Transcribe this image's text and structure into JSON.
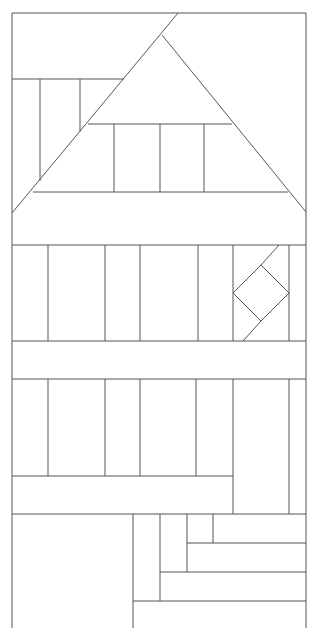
{
  "diagram": {
    "type": "quilt-block-house",
    "width": 309,
    "height": 628,
    "stroke_color": "#555555",
    "background": "#ffffff",
    "frame": {
      "points": [
        [
          12,
          628
        ],
        [
          12,
          13
        ],
        [
          306,
          13
        ],
        [
          306,
          628
        ]
      ]
    },
    "segments": [
      {
        "name": "roof-left-diagonal",
        "x1": 178,
        "y1": 13,
        "x2": 12,
        "y2": 213
      },
      {
        "name": "roof-right-diagonal",
        "x1": 162,
        "y1": 35,
        "x2": 306,
        "y2": 212
      },
      {
        "name": "chimney-top-line",
        "x1": 12,
        "y1": 79,
        "x2": 124,
        "y2": 79
      },
      {
        "name": "chimney-vertical-1",
        "x1": 40,
        "y1": 79,
        "x2": 40,
        "y2": 181
      },
      {
        "name": "chimney-vertical-2",
        "x1": 80,
        "y1": 79,
        "x2": 80,
        "y2": 132
      },
      {
        "name": "roof-inner-line",
        "x1": 88,
        "y1": 124,
        "x2": 232,
        "y2": 124
      },
      {
        "name": "roof-base-line",
        "x1": 33,
        "y1": 192,
        "x2": 288,
        "y2": 192
      },
      {
        "name": "roof-strip-vertical-1",
        "x1": 114,
        "y1": 124,
        "x2": 114,
        "y2": 192
      },
      {
        "name": "roof-strip-vertical-2",
        "x1": 160,
        "y1": 124,
        "x2": 160,
        "y2": 192
      },
      {
        "name": "roof-strip-vertical-3",
        "x1": 204,
        "y1": 124,
        "x2": 204,
        "y2": 192
      },
      {
        "name": "upper-row-top",
        "x1": 12,
        "y1": 245,
        "x2": 306,
        "y2": 245
      },
      {
        "name": "upper-row-bottom",
        "x1": 12,
        "y1": 341,
        "x2": 306,
        "y2": 341
      },
      {
        "name": "upper-vertical-1",
        "x1": 48,
        "y1": 245,
        "x2": 48,
        "y2": 341
      },
      {
        "name": "upper-vertical-2",
        "x1": 105,
        "y1": 245,
        "x2": 105,
        "y2": 341
      },
      {
        "name": "upper-vertical-3",
        "x1": 140,
        "y1": 245,
        "x2": 140,
        "y2": 341
      },
      {
        "name": "upper-vertical-4",
        "x1": 198,
        "y1": 245,
        "x2": 198,
        "y2": 341
      },
      {
        "name": "upper-vertical-5",
        "x1": 233,
        "y1": 245,
        "x2": 233,
        "y2": 341
      },
      {
        "name": "upper-vertical-6",
        "x1": 289,
        "y1": 245,
        "x2": 289,
        "y2": 341
      },
      {
        "name": "diamond-top-left",
        "x1": 261,
        "y1": 265,
        "x2": 233,
        "y2": 293
      },
      {
        "name": "diamond-top-right",
        "x1": 261,
        "y1": 265,
        "x2": 289,
        "y2": 293
      },
      {
        "name": "diamond-bottom-left",
        "x1": 233,
        "y1": 293,
        "x2": 261,
        "y2": 321
      },
      {
        "name": "diamond-bottom-right",
        "x1": 289,
        "y1": 293,
        "x2": 261,
        "y2": 321
      },
      {
        "name": "diamond-upper-tail",
        "x1": 279,
        "y1": 245,
        "x2": 261,
        "y2": 265
      },
      {
        "name": "diamond-lower-tail",
        "x1": 261,
        "y1": 321,
        "x2": 243,
        "y2": 341
      },
      {
        "name": "lower-row-top",
        "x1": 12,
        "y1": 379,
        "x2": 306,
        "y2": 379
      },
      {
        "name": "lower-vertical-1",
        "x1": 48,
        "y1": 379,
        "x2": 48,
        "y2": 476
      },
      {
        "name": "lower-vertical-2",
        "x1": 105,
        "y1": 379,
        "x2": 105,
        "y2": 476
      },
      {
        "name": "lower-vertical-3",
        "x1": 140,
        "y1": 379,
        "x2": 140,
        "y2": 476
      },
      {
        "name": "lower-vertical-4",
        "x1": 196,
        "y1": 379,
        "x2": 196,
        "y2": 476
      },
      {
        "name": "lower-vertical-5",
        "x1": 233,
        "y1": 379,
        "x2": 233,
        "y2": 514
      },
      {
        "name": "lower-vertical-6",
        "x1": 289,
        "y1": 379,
        "x2": 289,
        "y2": 514
      },
      {
        "name": "lower-row-bottom",
        "x1": 12,
        "y1": 476,
        "x2": 233,
        "y2": 476
      },
      {
        "name": "base-top-line",
        "x1": 12,
        "y1": 514,
        "x2": 306,
        "y2": 514
      },
      {
        "name": "base-vertical-1",
        "x1": 133,
        "y1": 514,
        "x2": 133,
        "y2": 628
      },
      {
        "name": "base-vertical-2",
        "x1": 160,
        "y1": 514,
        "x2": 160,
        "y2": 601
      },
      {
        "name": "base-vertical-3",
        "x1": 187,
        "y1": 514,
        "x2": 187,
        "y2": 572
      },
      {
        "name": "base-vertical-4",
        "x1": 213,
        "y1": 514,
        "x2": 213,
        "y2": 543
      },
      {
        "name": "base-step-1",
        "x1": 187,
        "y1": 543,
        "x2": 306,
        "y2": 543
      },
      {
        "name": "base-step-2",
        "x1": 160,
        "y1": 572,
        "x2": 306,
        "y2": 572
      },
      {
        "name": "base-step-3",
        "x1": 133,
        "y1": 601,
        "x2": 306,
        "y2": 601
      }
    ]
  }
}
